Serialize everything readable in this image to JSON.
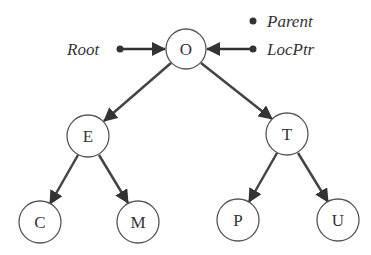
{
  "diagram": {
    "type": "binary-tree",
    "labels": {
      "root": "Root",
      "parent": "Parent",
      "locptr": "LocPtr"
    },
    "nodes": [
      {
        "id": "O",
        "label": "O"
      },
      {
        "id": "E",
        "label": "E"
      },
      {
        "id": "T",
        "label": "T"
      },
      {
        "id": "C",
        "label": "C"
      },
      {
        "id": "M",
        "label": "M"
      },
      {
        "id": "P",
        "label": "P"
      },
      {
        "id": "U",
        "label": "U"
      }
    ],
    "edges": [
      {
        "from": "O",
        "to": "E"
      },
      {
        "from": "O",
        "to": "T"
      },
      {
        "from": "E",
        "to": "C"
      },
      {
        "from": "E",
        "to": "M"
      },
      {
        "from": "T",
        "to": "P"
      },
      {
        "from": "T",
        "to": "U"
      },
      {
        "from": "Root",
        "to": "O"
      },
      {
        "from": "LocPtr",
        "to": "O"
      }
    ]
  }
}
